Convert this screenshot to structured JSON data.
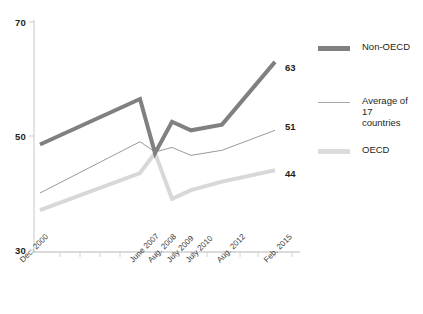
{
  "chart_data": {
    "type": "line",
    "title": "",
    "subtitle": "",
    "xlabel": "",
    "ylabel": "",
    "grid": false,
    "legend_position": "right",
    "ylim": [
      30,
      70
    ],
    "yticks": [
      30,
      50,
      70
    ],
    "ytick_labels": [
      "30",
      "50",
      "70"
    ],
    "categories": [
      "Dec. 2000",
      "June 2007",
      "Aug. 2008",
      "July 2009",
      "July 2010",
      "Aug. 2012",
      "Feb. 2015"
    ],
    "x_tick_labels": [
      "Dec. 2000",
      "June 2007",
      "Aug. 2008",
      "July 2009",
      "July 2010",
      "Aug. 2012",
      "Feb. 2015"
    ],
    "series": [
      {
        "name": "Non-OECD",
        "color": "#808080",
        "width": 4,
        "end_label": "63",
        "values": [
          48.5,
          56.5,
          47.0,
          52.5,
          51.0,
          52.0,
          63.0
        ]
      },
      {
        "name": "Average of 17 countries",
        "color": "#9a9a9a",
        "width": 1,
        "end_label": "51",
        "values": [
          40.0,
          49.0,
          47.2,
          48.0,
          46.6,
          47.5,
          51.0
        ]
      },
      {
        "name": "OECD",
        "color": "#d8d8d8",
        "width": 4,
        "end_label": "44",
        "values": [
          37.0,
          43.5,
          47.0,
          39.0,
          40.5,
          42.0,
          44.0
        ]
      }
    ]
  },
  "legend": {
    "items": [
      {
        "label": "Non-OECD",
        "color": "#808080",
        "thickness": "5"
      },
      {
        "label": "Average of 17\ncountries",
        "color": "#a8a8a8",
        "thickness": "1"
      },
      {
        "label": "OECD",
        "color": "#dcdcdc",
        "thickness": "5"
      }
    ]
  },
  "axis": {
    "y_values": [
      "70",
      "50",
      "30"
    ],
    "x_values": [
      "Dec. 2000",
      "June 2007",
      "Aug. 2008",
      "July 2009",
      "July 2010",
      "Aug. 2012",
      "Feb. 2015"
    ]
  },
  "end_labels": {
    "non_oecd": "63",
    "average17": "51",
    "oecd": "44"
  }
}
